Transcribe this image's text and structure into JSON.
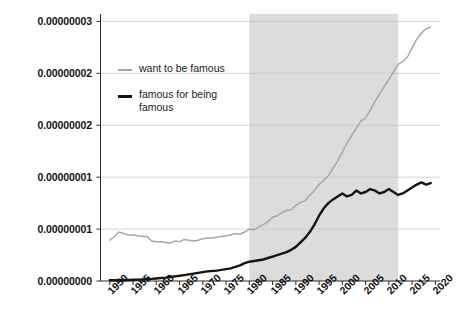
{
  "chart_data": {
    "type": "line",
    "title": "",
    "xlabel": "",
    "ylabel": "",
    "xlim": [
      1948,
      2021
    ],
    "ylim": [
      0,
      3.6e-08
    ],
    "grid": true,
    "legend_position": "inside-top-left",
    "y_ticks": [
      {
        "value": 0.0,
        "label": "0.00000000"
      },
      {
        "value": 7e-09,
        "label": "0.00000001"
      },
      {
        "value": 1.4e-08,
        "label": "0.00000001"
      },
      {
        "value": 2.1e-08,
        "label": "0.00000002"
      },
      {
        "value": 2.8e-08,
        "label": "0.00000002"
      },
      {
        "value": 3.5e-08,
        "label": "0.00000003"
      }
    ],
    "x_ticks": [
      "1950",
      "1955",
      "1960",
      "1965",
      "1970",
      "1975",
      "1980",
      "1985",
      "1990",
      "1995",
      "2000",
      "2005",
      "2010",
      "2015",
      "2020"
    ],
    "shaded_band": {
      "start": 1980,
      "end": 2012,
      "color": "#dcdcdc"
    },
    "colors": {
      "series_light": "#a8a8a8",
      "series_dark": "#141414",
      "axis": "#2a2a2a",
      "grid": "#c9c9c9",
      "band": "#dcdcdc"
    },
    "x": [
      1950,
      1951,
      1952,
      1953,
      1954,
      1955,
      1956,
      1957,
      1958,
      1959,
      1960,
      1961,
      1962,
      1963,
      1964,
      1965,
      1966,
      1967,
      1968,
      1969,
      1970,
      1971,
      1972,
      1973,
      1974,
      1975,
      1976,
      1977,
      1978,
      1979,
      1980,
      1981,
      1982,
      1983,
      1984,
      1985,
      1986,
      1987,
      1988,
      1989,
      1990,
      1991,
      1992,
      1993,
      1994,
      1995,
      1996,
      1997,
      1998,
      1999,
      2000,
      2001,
      2002,
      2003,
      2004,
      2005,
      2006,
      2007,
      2008,
      2009,
      2010,
      2011,
      2012,
      2013,
      2014,
      2015,
      2016,
      2017,
      2018,
      2019
    ],
    "series": [
      {
        "name": "want to be famous",
        "color": "#a8a8a8",
        "values": [
          5.5e-09,
          6e-09,
          6.6e-09,
          6.4e-09,
          6.2e-09,
          6.2e-09,
          6.1e-09,
          6e-09,
          6e-09,
          5.4e-09,
          5.3e-09,
          5.3e-09,
          5.2e-09,
          5.1e-09,
          5.4e-09,
          5.3e-09,
          5.6e-09,
          5.5e-09,
          5.4e-09,
          5.5e-09,
          5.7e-09,
          5.8e-09,
          5.8e-09,
          5.9e-09,
          6e-09,
          6.1e-09,
          6.2e-09,
          6.4e-09,
          6.3e-09,
          6.6e-09,
          7e-09,
          6.9e-09,
          7.3e-09,
          7.6e-09,
          8e-09,
          8.6e-09,
          8.8e-09,
          9.2e-09,
          9.5e-09,
          9.6e-09,
          1.02e-08,
          1.06e-08,
          1.08e-08,
          1.16e-08,
          1.22e-08,
          1.3e-08,
          1.36e-08,
          1.42e-08,
          1.52e-08,
          1.62e-08,
          1.74e-08,
          1.86e-08,
          1.96e-08,
          2.06e-08,
          2.16e-08,
          2.2e-08,
          2.3e-08,
          2.42e-08,
          2.52e-08,
          2.62e-08,
          2.72e-08,
          2.82e-08,
          2.92e-08,
          2.96e-08,
          3.02e-08,
          3.14e-08,
          3.26e-08,
          3.34e-08,
          3.4e-08,
          3.42e-08
        ]
      },
      {
        "name": "famous for being famous",
        "color": "#141414",
        "values": [
          1e-10,
          1.1e-10,
          1.2e-10,
          1.3e-10,
          1.4e-10,
          1.6e-10,
          1.8e-10,
          2e-10,
          2.4e-10,
          2.8e-10,
          3.4e-10,
          4e-10,
          4.6e-10,
          5.4e-10,
          6.2e-10,
          7e-10,
          8e-10,
          9e-10,
          1e-09,
          1.1e-09,
          1.2e-09,
          1.3e-09,
          1.35e-09,
          1.4e-09,
          1.5e-09,
          1.6e-09,
          1.7e-09,
          1.9e-09,
          2.1e-09,
          2.4e-09,
          2.6e-09,
          2.7e-09,
          2.8e-09,
          2.9e-09,
          3.1e-09,
          3.3e-09,
          3.5e-09,
          3.7e-09,
          3.9e-09,
          4.2e-09,
          4.6e-09,
          5.2e-09,
          5.8e-09,
          6.6e-09,
          7.6e-09,
          8.8e-09,
          9.8e-09,
          1.05e-08,
          1.1e-08,
          1.14e-08,
          1.18e-08,
          1.14e-08,
          1.16e-08,
          1.22e-08,
          1.18e-08,
          1.2e-08,
          1.24e-08,
          1.22e-08,
          1.18e-08,
          1.2e-08,
          1.24e-08,
          1.2e-08,
          1.16e-08,
          1.18e-08,
          1.22e-08,
          1.26e-08,
          1.3e-08,
          1.33e-08,
          1.3e-08,
          1.32e-08
        ]
      }
    ]
  }
}
